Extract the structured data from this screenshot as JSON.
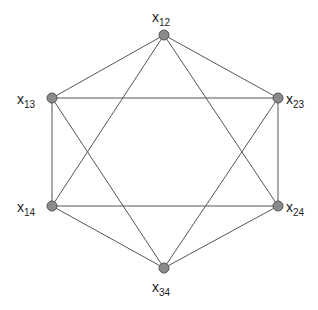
{
  "diagram": {
    "type": "graph",
    "node_color": "#8a8a8a",
    "edge_color": "#555555",
    "nodes": [
      {
        "id": "x12",
        "base": "x",
        "sub": "12",
        "x": 164,
        "y": 35,
        "lx": 152,
        "ly": 22
      },
      {
        "id": "x13",
        "base": "x",
        "sub": "13",
        "x": 52,
        "y": 98,
        "lx": 17,
        "ly": 104
      },
      {
        "id": "x23",
        "base": "x",
        "sub": "23",
        "x": 278,
        "y": 98,
        "lx": 286,
        "ly": 104
      },
      {
        "id": "x14",
        "base": "x",
        "sub": "14",
        "x": 52,
        "y": 206,
        "lx": 17,
        "ly": 212
      },
      {
        "id": "x24",
        "base": "x",
        "sub": "24",
        "x": 278,
        "y": 206,
        "lx": 286,
        "ly": 212
      },
      {
        "id": "x34",
        "base": "x",
        "sub": "34",
        "x": 164,
        "y": 268,
        "lx": 152,
        "ly": 292
      }
    ],
    "edges": [
      [
        "x12",
        "x13"
      ],
      [
        "x12",
        "x23"
      ],
      [
        "x13",
        "x14"
      ],
      [
        "x23",
        "x24"
      ],
      [
        "x14",
        "x34"
      ],
      [
        "x24",
        "x34"
      ],
      [
        "x13",
        "x23"
      ],
      [
        "x14",
        "x24"
      ],
      [
        "x12",
        "x14"
      ],
      [
        "x12",
        "x24"
      ],
      [
        "x13",
        "x34"
      ],
      [
        "x23",
        "x34"
      ]
    ]
  }
}
